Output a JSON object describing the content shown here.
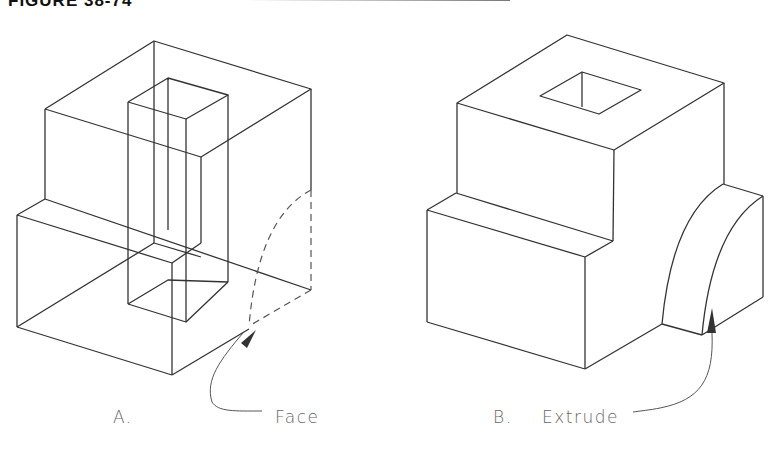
{
  "figure": {
    "title": "FIGURE 38-74"
  },
  "views": [
    {
      "id": "A",
      "caption_letter": "A.",
      "callout": "Face",
      "description": "Wireframe stepped block with rectangular through-hole and dashed quarter-circle face profile"
    },
    {
      "id": "B",
      "caption_letter": "B.",
      "callout": "Extrude",
      "description": "Solid stepped block with square hole on top and extruded quarter-round boss"
    }
  ],
  "colors": {
    "line": "#333333",
    "dashed": "#555555",
    "leader": "#555555",
    "text": "#666666"
  }
}
